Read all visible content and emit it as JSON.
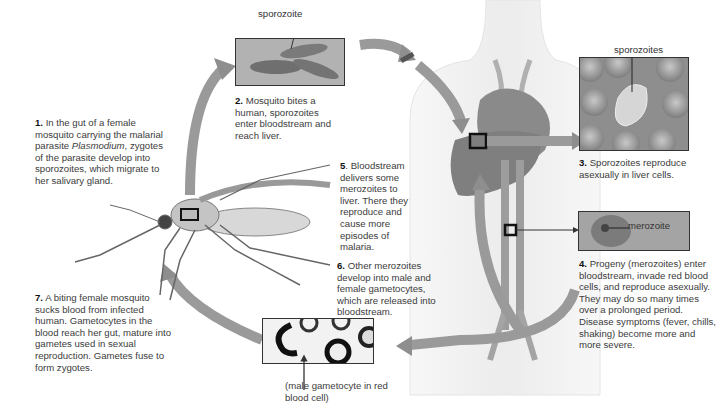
{
  "diagram": {
    "steps": [
      {
        "number": "1.",
        "text_a": "In the gut of a female mosquito carrying the malarial parasite ",
        "italic": "Plasmodium",
        "text_b": ", zygotes of the parasite develop into sporozoites, which migrate to her salivary gland."
      },
      {
        "number": "2.",
        "text": "Mosquito bites a human, sporozoites enter bloodstream and reach liver."
      },
      {
        "number": "3.",
        "text": "Sporozoites reproduce asexually in liver cells."
      },
      {
        "number": "4.",
        "text": "Progeny (merozoites) enter bloodstream, invade red blood cells, and reproduce asexually. They may do so many times over a prolonged period. Disease symptoms (fever, chills, shaking) become more and more severe."
      },
      {
        "number": "5",
        "text": ". Bloodstream delivers some merozoites to liver. There they reproduce and cause more episodes of malaria."
      },
      {
        "number": "6.",
        "text": "Other merozoites develop into male and female gametocytes, which are released into bloodstream."
      },
      {
        "number": "7.",
        "text": "A biting female mosquito sucks blood from infected human. Gametocytes in the blood reach her gut, mature into gametes used in sexual reproduction. Gametes fuse to form zygotes."
      }
    ],
    "labels": {
      "sporozoite": "sporozoite",
      "sporozoites": "sporozoites",
      "merozoite": "merozoite",
      "gametocyte": "(male gametocyte in red blood cell)"
    },
    "colors": {
      "arrow": "#9a9a9a",
      "panel_bg": "#a9a9a9",
      "liver": "#8c8c8c",
      "text": "#3c3c3c"
    }
  }
}
